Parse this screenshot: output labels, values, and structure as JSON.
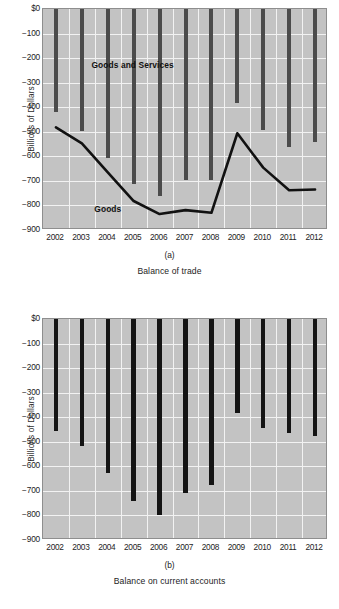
{
  "figure": {
    "panels": [
      {
        "id": "a",
        "panel_letter": "(a)",
        "caption": "Balance of trade",
        "ylabel": "Billions of Dollars",
        "series_labels": [
          {
            "text": "Goods and Services",
            "x_frac": 0.17,
            "y_value": -232
          },
          {
            "text": "Goods",
            "x_frac": 0.18,
            "y_value": -818
          }
        ]
      },
      {
        "id": "b",
        "panel_letter": "(b)",
        "caption": "Balance on current accounts",
        "ylabel": "Billions of Dollars",
        "series_labels": []
      }
    ]
  },
  "chart_data": [
    {
      "type": "bar",
      "id": "a",
      "title": "Balance of trade",
      "panel_letter": "(a)",
      "xlabel": "",
      "ylabel": "Billions of Dollars",
      "ylim": [
        -900,
        0
      ],
      "ytick_values": [
        0,
        -100,
        -200,
        -300,
        -400,
        -500,
        -600,
        -700,
        -800,
        -900
      ],
      "ytick_labels": [
        "$0",
        "-100",
        "-200",
        "-300",
        "-400",
        "-500",
        "-600",
        "-700",
        "-800",
        "-900"
      ],
      "categories": [
        "2002",
        "2003",
        "2004",
        "2005",
        "2006",
        "2007",
        "2008",
        "2009",
        "2010",
        "2011",
        "2012"
      ],
      "grid": true,
      "legend": "inline-labels",
      "series": [
        {
          "name": "Goods and Services",
          "render": "bar",
          "color": "#4b4b4b",
          "values": [
            -421,
            -496,
            -607,
            -711,
            -762,
            -696,
            -698,
            -381,
            -494,
            -560,
            -540
          ]
        },
        {
          "name": "Goods",
          "render": "line",
          "color": "#111111",
          "values": [
            -482,
            -547,
            -665,
            -782,
            -835,
            -819,
            -830,
            -506,
            -646,
            -738,
            -735
          ]
        }
      ]
    },
    {
      "type": "bar",
      "id": "b",
      "title": "Balance on current accounts",
      "panel_letter": "(b)",
      "xlabel": "",
      "ylabel": "Billions of Dollars",
      "ylim": [
        -900,
        0
      ],
      "ytick_values": [
        0,
        -100,
        -200,
        -300,
        -400,
        -500,
        -600,
        -700,
        -800,
        -900
      ],
      "ytick_labels": [
        "$0",
        "-100",
        "-200",
        "-300",
        "-400",
        "-500",
        "-600",
        "-700",
        "-800",
        "-900"
      ],
      "categories": [
        "2002",
        "2003",
        "2004",
        "2005",
        "2006",
        "2007",
        "2008",
        "2009",
        "2010",
        "2011",
        "2012"
      ],
      "grid": true,
      "series": [
        {
          "name": "Balance on current accounts",
          "render": "bar",
          "color": "#141414",
          "values": [
            -458,
            -519,
            -628,
            -740,
            -798,
            -707,
            -677,
            -381,
            -442,
            -466,
            -475
          ]
        }
      ]
    }
  ],
  "colors": {
    "plot_background": "#c3c3c3",
    "gridline": "#f2f2f2",
    "bar_a": "#4b4b4b",
    "bar_b": "#141414",
    "line_goods": "#111111",
    "text": "#1d1d1d"
  }
}
